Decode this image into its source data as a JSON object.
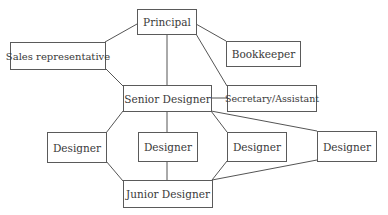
{
  "diagram": {
    "nodes": [
      {
        "id": "principal",
        "label": "Principal"
      },
      {
        "id": "sales",
        "label": "Sales representative"
      },
      {
        "id": "bookkeeper",
        "label": "Bookkeeper"
      },
      {
        "id": "senior",
        "label": "Senior Designer"
      },
      {
        "id": "secretary",
        "label": "Secretary/Assistant"
      },
      {
        "id": "designer1",
        "label": "Designer"
      },
      {
        "id": "designer2",
        "label": "Designer"
      },
      {
        "id": "designer3",
        "label": "Designer"
      },
      {
        "id": "designer4",
        "label": "Designer"
      },
      {
        "id": "junior",
        "label": "Junior Designer"
      }
    ],
    "edges": [
      [
        "principal",
        "sales"
      ],
      [
        "principal",
        "senior"
      ],
      [
        "principal",
        "bookkeeper"
      ],
      [
        "principal",
        "secretary"
      ],
      [
        "sales",
        "senior"
      ],
      [
        "senior",
        "secretary"
      ],
      [
        "senior",
        "designer1"
      ],
      [
        "senior",
        "designer2"
      ],
      [
        "senior",
        "designer3"
      ],
      [
        "senior",
        "designer4"
      ],
      [
        "designer1",
        "junior"
      ],
      [
        "designer2",
        "junior"
      ],
      [
        "designer3",
        "junior"
      ],
      [
        "designer4",
        "junior"
      ]
    ]
  }
}
